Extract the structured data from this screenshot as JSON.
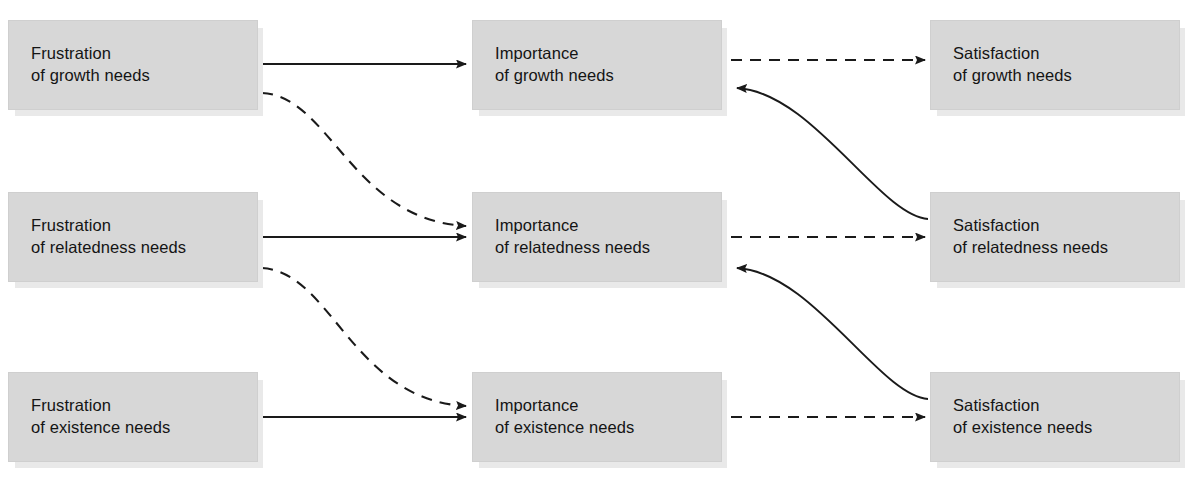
{
  "figure": {
    "title_fragment": "",
    "type": "process-flow-diagram",
    "columns": [
      "Frustration",
      "Importance",
      "Satisfaction"
    ],
    "rows": [
      "growth needs",
      "relatedness needs",
      "existence needs"
    ],
    "colors": {
      "node_fill": "#d7d7d7",
      "node_shadow": "#e9e9e9",
      "node_border": "#cfcfcf",
      "edge": "#1a1a1a",
      "text": "#141414",
      "background": "#ffffff"
    }
  },
  "nodes": {
    "frustration_growth": {
      "line1": "Frustration",
      "line2": "of growth needs"
    },
    "frustration_relatedness": {
      "line1": "Frustration",
      "line2": "of relatedness needs"
    },
    "frustration_existence": {
      "line1": "Frustration",
      "line2": "of existence needs"
    },
    "importance_growth": {
      "line1": "Importance",
      "line2": "of growth needs"
    },
    "importance_relatedness": {
      "line1": "Importance",
      "line2": "of relatedness needs"
    },
    "importance_existence": {
      "line1": "Importance",
      "line2": "of existence needs"
    },
    "satisfaction_growth": {
      "line1": "Satisfaction",
      "line2": "of growth needs"
    },
    "satisfaction_relatedness": {
      "line1": "Satisfaction",
      "line2": "of relatedness needs"
    },
    "satisfaction_existence": {
      "line1": "Satisfaction",
      "line2": "of existence needs"
    }
  },
  "node_text": {
    "frustration_growth": "Frustration\nof growth needs",
    "frustration_relatedness": "Frustration\nof relatedness needs",
    "frustration_existence": "Frustration\nof existence needs",
    "importance_growth": "Importance\nof growth needs",
    "importance_relatedness": "Importance\nof relatedness needs",
    "importance_existence": "Importance\nof existence needs",
    "satisfaction_growth": "Satisfaction\nof growth needs",
    "satisfaction_relatedness": "Satisfaction\nof relatedness needs",
    "satisfaction_existence": "Satisfaction\nof existence needs"
  },
  "edges": [
    {
      "id": "solid-growth-frustration-to-importance",
      "from": "frustration_growth",
      "to": "importance_growth",
      "style": "solid",
      "shape": "straight"
    },
    {
      "id": "solid-relatedness-frustration-to-importance",
      "from": "frustration_relatedness",
      "to": "importance_relatedness",
      "style": "solid",
      "shape": "straight"
    },
    {
      "id": "solid-existence-frustration-to-importance",
      "from": "frustration_existence",
      "to": "importance_existence",
      "style": "solid",
      "shape": "straight"
    },
    {
      "id": "dashed-growth-importance-to-satisfaction",
      "from": "importance_growth",
      "to": "satisfaction_growth",
      "style": "dashed",
      "shape": "straight"
    },
    {
      "id": "dashed-relatedness-importance-to-satisfaction",
      "from": "importance_relatedness",
      "to": "satisfaction_relatedness",
      "style": "dashed",
      "shape": "straight"
    },
    {
      "id": "dashed-existence-importance-to-satisfaction",
      "from": "importance_existence",
      "to": "satisfaction_existence",
      "style": "dashed",
      "shape": "straight"
    },
    {
      "id": "dashed-curve-frustration-growth-to-importance-relatedness",
      "from": "frustration_growth",
      "to": "importance_relatedness",
      "style": "dashed",
      "shape": "s-curve"
    },
    {
      "id": "dashed-curve-frustration-relatedness-to-importance-existence",
      "from": "frustration_relatedness",
      "to": "importance_existence",
      "style": "dashed",
      "shape": "s-curve"
    },
    {
      "id": "solid-curve-satisfaction-relatedness-to-importance-growth",
      "from": "satisfaction_relatedness",
      "to": "importance_growth",
      "style": "solid",
      "shape": "s-curve"
    },
    {
      "id": "solid-curve-satisfaction-existence-to-importance-relatedness",
      "from": "satisfaction_existence",
      "to": "importance_relatedness",
      "style": "solid",
      "shape": "s-curve"
    }
  ]
}
